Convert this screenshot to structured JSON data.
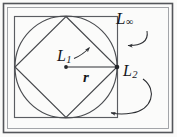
{
  "figure": {
    "background_color": "#fbfbfa",
    "stroke_color": "#3a3c40",
    "text_color": "#15161a",
    "width": 177,
    "height": 137
  },
  "labels": {
    "l_infinity": {
      "base": "L",
      "subscript": "∞",
      "full": "L∞"
    },
    "l_one": {
      "base": "L",
      "subscript": "1",
      "full": "L1"
    },
    "l_two": {
      "base": "L",
      "subscript": "2",
      "full": "L2"
    },
    "radius": {
      "full": "r"
    }
  },
  "geometry": {
    "outer_frame": {
      "x": 3,
      "y": 3,
      "width": 170,
      "height": 130
    },
    "inner_frame": {
      "x": 7,
      "y": 7,
      "width": 162,
      "height": 122
    },
    "square": {
      "x": 14,
      "y": 16,
      "width": 104,
      "height": 102
    },
    "circle": {
      "cx": 66,
      "cy": 67,
      "r": 51
    },
    "diamond_vertices": [
      {
        "x": 66,
        "y": 16
      },
      {
        "x": 117,
        "y": 67
      },
      {
        "x": 66,
        "y": 118
      },
      {
        "x": 15,
        "y": 67
      }
    ],
    "radius_line": {
      "x1": 66,
      "y1": 67,
      "x2": 117,
      "y2": 67
    },
    "center_dot": {
      "cx": 66,
      "cy": 67,
      "r": 1.8
    },
    "right_vertex_dot": {
      "cx": 117,
      "cy": 67,
      "r": 2.2
    }
  },
  "annotations": [
    {
      "name": "l-infinity-leader",
      "label": "L∞",
      "path": "M 146 31 C 146 42, 136 45, 126 45",
      "arrow_at": {
        "x": 119,
        "y": 45
      }
    },
    {
      "name": "l-one-leader",
      "label": "L1",
      "path": "M 74 58 C 80 55, 84 52, 88 48",
      "arrow_at": {
        "x": 90,
        "y": 46
      }
    },
    {
      "name": "l-two-leader",
      "label": "L2",
      "path": "M 142 80 C 156 90, 150 110, 130 113 C 122 114, 114 114, 110 113",
      "arrow_at": {
        "x": 106,
        "y": 112
      }
    }
  ]
}
